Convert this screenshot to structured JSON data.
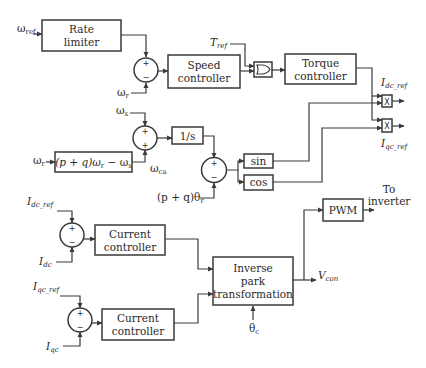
{
  "diagram": {
    "title": "",
    "colors": {
      "line": "#3a3a3a",
      "text": "#2a2a2a",
      "background": "#ffffff"
    },
    "blocks": {
      "rate_limiter": {
        "line1": "Rate",
        "line2": "limiter"
      },
      "speed_controller": {
        "line1": "Speed",
        "line2": "controller"
      },
      "torque_controller": {
        "line1": "Torque",
        "line2": "controller"
      },
      "integrator": {
        "label": "1/s"
      },
      "slip_calc": {
        "label": "(p + q)ω",
        "sub": "r",
        "suffix": " − ω",
        "sub2": "s"
      },
      "sin": {
        "label": "sin"
      },
      "cos": {
        "label": "cos"
      },
      "multiplier_d": {
        "label": "X"
      },
      "multiplier_q": {
        "label": "X"
      },
      "current_controller_d": {
        "line1": "Current",
        "line2": "controller"
      },
      "current_controller_q": {
        "line1": "Current",
        "line2": "controller"
      },
      "inverse_park": {
        "line1": "Inverse",
        "line2": "park",
        "line3": "transformation"
      },
      "pwm": {
        "label": "PWM"
      }
    },
    "summing_junctions": [
      {
        "id": "sum-speed",
        "top": "+",
        "bottom": "−"
      },
      {
        "id": "sum-slip",
        "top": "+",
        "bottom": "+"
      },
      {
        "id": "sum-angle",
        "top": "+",
        "bottom": "−"
      },
      {
        "id": "sum-id",
        "top": "+",
        "bottom": "−"
      },
      {
        "id": "sum-iq",
        "top": "+",
        "bottom": "−"
      }
    ],
    "signals": {
      "omega_ref": {
        "main": "ω",
        "sub": "ref"
      },
      "omega_r_1": {
        "main": "ω",
        "sub": "r"
      },
      "omega_s": {
        "main": "ω",
        "sub": "s"
      },
      "omega_r_2": {
        "main": "ω",
        "sub": "r"
      },
      "omega_ca": {
        "main": "ω",
        "sub": "ca"
      },
      "theta_r": {
        "main": "(p + q)θ",
        "sub": "r"
      },
      "t_ref": {
        "main": "T",
        "sub": "ref"
      },
      "idc_ref_out": {
        "main": "I",
        "sub": "dc_ref"
      },
      "iqc_ref_out": {
        "main": "I",
        "sub": "qc_ref"
      },
      "idc_ref_in": {
        "main": "I",
        "sub": "dc_ref"
      },
      "idc": {
        "main": "I",
        "sub": "dc"
      },
      "iqc_ref_in": {
        "main": "I",
        "sub": "qc_ref"
      },
      "iqc": {
        "main": "I",
        "sub": "qc"
      },
      "v_con": {
        "main": "V",
        "sub": "con"
      },
      "theta_c": {
        "main": "θ",
        "sub": "c"
      },
      "to_inverter": {
        "line1": "To",
        "line2": "inverter"
      }
    }
  }
}
